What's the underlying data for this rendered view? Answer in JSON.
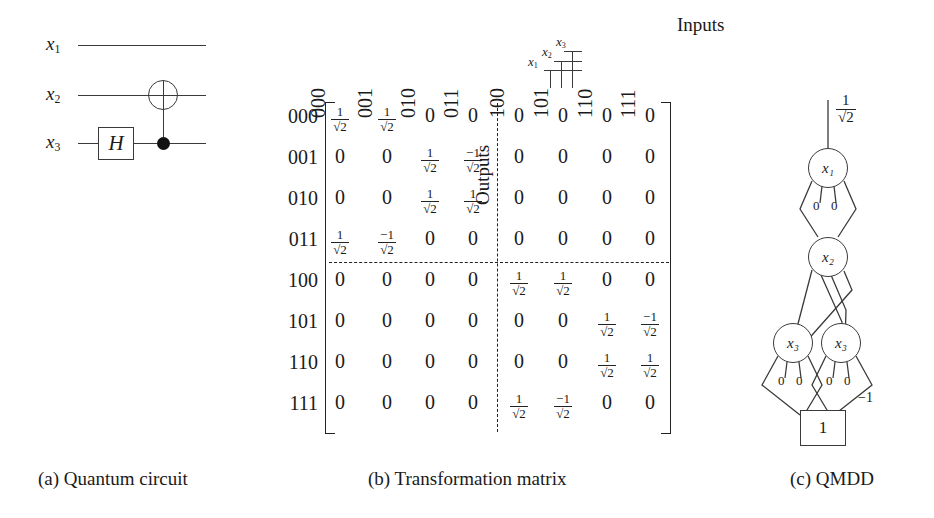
{
  "figure": {
    "captions": [
      {
        "id": "a",
        "text": "(a) Quantum circuit"
      },
      {
        "id": "b",
        "text": "(b) Transformation matrix"
      },
      {
        "id": "c",
        "text": "(c) QMDD"
      }
    ]
  },
  "circuit": {
    "wire_labels": [
      "x1",
      "x2",
      "x3"
    ],
    "wire_labels_display": [
      "x₁",
      "x₂",
      "x₃"
    ],
    "gates": [
      {
        "name": "hadamard-gate",
        "label": "H",
        "target_wire": "x3"
      },
      {
        "name": "cnot-gate",
        "control_wire": "x3",
        "target_wire": "x2",
        "control_label": "●",
        "target_label": "⊕"
      }
    ]
  },
  "matrix": {
    "inputs_label": "Inputs",
    "outputs_label": "Outputs",
    "key_labels": [
      "x1",
      "x2",
      "x3"
    ],
    "col_headers": [
      "000",
      "001",
      "010",
      "011",
      "100",
      "101",
      "110",
      "111"
    ],
    "row_headers": [
      "000",
      "001",
      "010",
      "011",
      "100",
      "101",
      "110",
      "111"
    ],
    "rows": [
      [
        "1/√2",
        "1/√2",
        "0",
        "0",
        "0",
        "0",
        "0",
        "0"
      ],
      [
        "0",
        "0",
        "1/√2",
        "-1/√2",
        "0",
        "0",
        "0",
        "0"
      ],
      [
        "0",
        "0",
        "1/√2",
        "1/√2",
        "0",
        "0",
        "0",
        "0"
      ],
      [
        "1/√2",
        "-1/√2",
        "0",
        "0",
        "0",
        "0",
        "0",
        "0"
      ],
      [
        "0",
        "0",
        "0",
        "0",
        "1/√2",
        "1/√2",
        "0",
        "0"
      ],
      [
        "0",
        "0",
        "0",
        "0",
        "0",
        "0",
        "1/√2",
        "-1/√2"
      ],
      [
        "0",
        "0",
        "0",
        "0",
        "0",
        "0",
        "1/√2",
        "1/√2"
      ],
      [
        "0",
        "0",
        "0",
        "0",
        "1/√2",
        "-1/√2",
        "0",
        "0"
      ]
    ],
    "block_divider": {
      "after_row": 4,
      "after_col": 4,
      "style": "dashed"
    }
  },
  "qmdd": {
    "root_weight": "1/√2",
    "root_weight_num": "1",
    "root_weight_den": "√2",
    "nodes": [
      {
        "id": "n-x1",
        "label": "x1",
        "label_display": "x₁",
        "level": 1
      },
      {
        "id": "n-x2",
        "label": "x2",
        "label_display": "x₂",
        "level": 2
      },
      {
        "id": "n-x3-left",
        "label": "x3",
        "label_display": "x₃",
        "level": 3
      },
      {
        "id": "n-x3-right",
        "label": "x3",
        "label_display": "x₃",
        "level": 3
      }
    ],
    "terminal": {
      "id": "t-one",
      "label": "1"
    },
    "zero_stubs_label": "0",
    "edge_weight_labels": [
      "-1"
    ],
    "negative_edge_label": "−1"
  }
}
